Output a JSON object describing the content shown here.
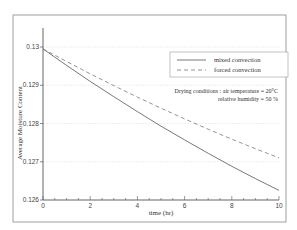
{
  "chart_data": {
    "type": "line",
    "title": "",
    "xlabel": "time (hr)",
    "ylabel": "Average Moisture Content",
    "xlim": [
      0,
      10
    ],
    "ylim": [
      0.126,
      0.13
    ],
    "xticks": [
      0,
      2,
      4,
      6,
      8,
      10
    ],
    "xtick_labels": [
      "0",
      "2",
      "4",
      "6",
      "8",
      "10"
    ],
    "yticks": [
      0.126,
      0.127,
      0.128,
      0.129,
      0.13
    ],
    "ytick_labels": [
      "0.126",
      "0.127",
      "0.128",
      "0.129",
      "0.13"
    ],
    "grid": "horizontal",
    "legend_position": "upper right",
    "x": [
      0,
      1,
      2,
      3,
      4,
      5,
      6,
      7,
      8,
      9,
      10
    ],
    "series": [
      {
        "name": "mixed convection",
        "style": "solid",
        "color": "#555555",
        "values": [
          0.12995,
          0.12952,
          0.1291,
          0.1287,
          0.12831,
          0.12793,
          0.12757,
          0.12722,
          0.12688,
          0.12656,
          0.12625
        ]
      },
      {
        "name": "forced convection",
        "style": "dashed",
        "color": "#777777",
        "values": [
          0.12995,
          0.12962,
          0.1293,
          0.12899,
          0.12869,
          0.1284,
          0.12812,
          0.12785,
          0.12759,
          0.12734,
          0.1271
        ]
      }
    ],
    "annotations": [
      "Drying conditions : air temperature = 20°C",
      "relative humidity = 50 %"
    ]
  },
  "labels": {
    "xlabel": "time (hr)",
    "ylabel": "Average Moisture Content",
    "legend_mixed": "mixed convection",
    "legend_forced": "forced convection",
    "note_line1": "Drying conditions : air temperature = 20°C",
    "note_line2": "relative humidity = 50 %"
  }
}
